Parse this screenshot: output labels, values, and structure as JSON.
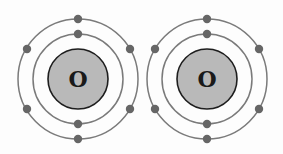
{
  "diagram": {
    "type": "bohr-model",
    "colors": {
      "background": "#fdfdfd",
      "nucleus_fill": "#b9b9b9",
      "nucleus_stroke": "#1e1e1e",
      "shell_stroke": "#7a7a7a",
      "electron_fill": "#666666"
    },
    "atoms": [
      {
        "symbol": "O",
        "center": [
          78,
          79
        ],
        "nucleus_radius": 30,
        "shells": [
          {
            "radius": 45,
            "electrons": 2
          },
          {
            "radius": 60,
            "electrons": 6
          }
        ]
      },
      {
        "symbol": "O",
        "center": [
          207,
          79
        ],
        "nucleus_radius": 30,
        "shells": [
          {
            "radius": 45,
            "electrons": 2
          },
          {
            "radius": 60,
            "electrons": 6
          }
        ]
      }
    ]
  }
}
